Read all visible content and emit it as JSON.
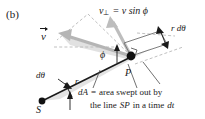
{
  "figure": {
    "panel_tag": "(b)",
    "type": "physics-diagram",
    "background_color": "#ffffff",
    "ink_color": "#1a1a1a",
    "shade_color": "#d9d9d9",
    "dash_color": "#b3b3b3"
  },
  "labels": {
    "velocity_vector": "v",
    "perp_component_symbol": "v",
    "perp_component_subscript": "⊥",
    "perp_component_equation": "= v sin ϕ",
    "arc_length": "r dθ",
    "angle_phi": "ϕ",
    "angle_dtheta": "dθ",
    "radius": "r",
    "point_p": "P",
    "point_s": "S"
  },
  "caption": {
    "line1_symbol": "dA",
    "line1_equals": "=",
    "line1_text": "area swept out by",
    "line2_prefix": "the line",
    "line2_symbol": "SP",
    "line2_middle": "in a time",
    "line2_symbol2": "dt"
  },
  "geometry": {
    "point_S": [
      42,
      101
    ],
    "point_P": [
      131,
      56
    ],
    "radius_line": "S to P",
    "swept_parallelogram": "P toward upper-right along r d-theta",
    "angle_at_P": "phi between radius line and velocity vector"
  }
}
